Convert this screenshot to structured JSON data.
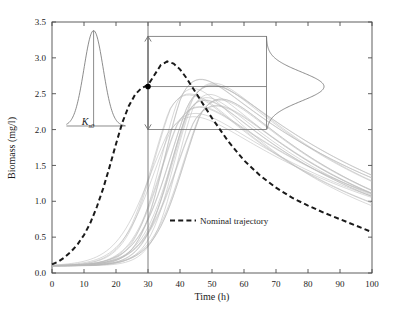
{
  "chart_data": {
    "type": "line",
    "title": "",
    "xlabel": "Time (h)",
    "ylabel": "Biomass (mg/l)",
    "xlim": [
      0,
      100
    ],
    "ylim": [
      0.0,
      3.5
    ],
    "xticks": [
      0,
      10,
      20,
      30,
      40,
      50,
      60,
      70,
      80,
      90,
      100
    ],
    "yticks": [
      0.0,
      0.5,
      1.0,
      1.5,
      2.0,
      2.5,
      3.0,
      3.5
    ],
    "xtick_labels": [
      "0",
      "10",
      "20",
      "30",
      "40",
      "50",
      "60",
      "70",
      "80",
      "90",
      "100"
    ],
    "ytick_labels": [
      "0.0",
      "0.5",
      "1.0",
      "1.5",
      "2.0",
      "2.5",
      "3.0",
      "3.5"
    ],
    "grid": false,
    "legend": {
      "position": "center-right-inside",
      "entries": [
        {
          "label": "Nominal trajectory",
          "style": "dashed",
          "color": "#1a1a1a"
        }
      ]
    },
    "colors": {
      "ensemble": "#b9b9b9",
      "nominal": "#1a1a1a",
      "inset_line": "#6f6f6f",
      "frame": "#4d4d4d",
      "marker": "#000000"
    },
    "series": [
      {
        "name": "Nominal trajectory",
        "style": "dashed",
        "x": [
          0,
          2,
          4,
          6,
          8,
          10,
          12,
          14,
          16,
          18,
          20,
          22,
          24,
          26,
          28,
          30,
          32,
          34,
          36,
          38,
          40,
          42,
          44,
          46,
          48,
          50,
          55,
          60,
          65,
          70,
          75,
          80,
          85,
          90,
          95,
          100
        ],
        "y": [
          0.12,
          0.16,
          0.22,
          0.3,
          0.4,
          0.53,
          0.7,
          0.92,
          1.18,
          1.48,
          1.8,
          2.1,
          2.33,
          2.49,
          2.58,
          2.62,
          2.76,
          2.9,
          2.95,
          2.92,
          2.84,
          2.72,
          2.58,
          2.44,
          2.3,
          2.16,
          1.84,
          1.57,
          1.36,
          1.19,
          1.05,
          0.94,
          0.84,
          0.75,
          0.66,
          0.57
        ]
      }
    ],
    "ensemble": {
      "name": "Monte Carlo realizations",
      "n_shown": 22,
      "style": "solid-light",
      "t0_value": 0.1,
      "peak_range": [
        2.7,
        3.25
      ],
      "peak_time_range": [
        31,
        42
      ],
      "t100_range": [
        0.5,
        0.65
      ]
    },
    "annotations": [
      {
        "kind": "vertical-line",
        "x": 30,
        "label": "decision time"
      },
      {
        "kind": "double-arrow",
        "x": 30,
        "y_low": 2.0,
        "y_high": 3.3
      },
      {
        "kind": "marker-point",
        "x": 30,
        "y": 2.6
      },
      {
        "kind": "horizontal-line",
        "y": 2.6,
        "x_from": 30,
        "x_to": 67
      },
      {
        "kind": "box",
        "x_from": 30,
        "x_to": 67,
        "y_from": 2.0,
        "y_to": 3.3
      },
      {
        "kind": "inset-label",
        "text": "K",
        "subscript": "s0",
        "x": 13,
        "y": 1.92
      }
    ],
    "inset_left": {
      "name": "prior-distribution-Ks0",
      "type": "line",
      "shape": "gaussian",
      "label": "K",
      "label_subscript": "s0",
      "x_center": 13,
      "x_from": 4.5,
      "x_to": 23,
      "baseline_y": 2.05,
      "peak_y": 3.38
    },
    "inset_right": {
      "name": "predicted-output-distribution",
      "type": "line",
      "shape": "gaussian-rotated",
      "orientation": "vertical-sideways",
      "center_y": 2.6,
      "y_from": 2.0,
      "y_to": 3.3,
      "x_base": 67,
      "x_peak": 85
    }
  },
  "axes": {
    "xlabel": "Time (h)",
    "ylabel": "Biomass (mg/l)",
    "xtick_labels": [
      "0",
      "10",
      "20",
      "30",
      "40",
      "50",
      "60",
      "70",
      "80",
      "90",
      "100"
    ],
    "ytick_labels": [
      "0.0",
      "0.5",
      "1.0",
      "1.5",
      "2.0",
      "2.5",
      "3.0",
      "3.5"
    ]
  },
  "legend": {
    "nominal_label": "Nominal trajectory"
  },
  "inset": {
    "k_label": "K",
    "k_subscript": "s0"
  }
}
